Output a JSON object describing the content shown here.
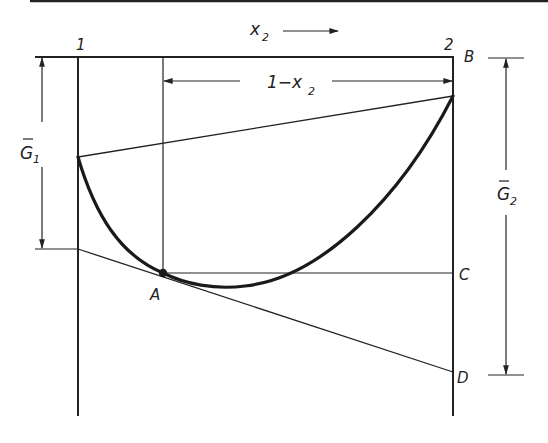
{
  "diagram": {
    "type": "binary free energy of mixing (tangent construction)",
    "labels": {
      "x_axis": "x",
      "x_axis_sub": "2",
      "pure_1": "1",
      "pure_2": "2",
      "one_minus_x": "1−x",
      "one_minus_x_sub": "2",
      "g1_bar": "G",
      "g1_sub": "1",
      "g2_bar": "G",
      "g2_sub": "2",
      "point_A": "A",
      "point_B": "B",
      "point_C": "C",
      "point_D": "D"
    },
    "colors": {
      "line": "#222222",
      "background": "#ffffff"
    }
  }
}
